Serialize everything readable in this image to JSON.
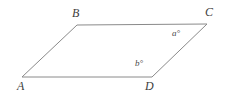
{
  "figure": {
    "type": "parallelogram",
    "background_color": "#ffffff",
    "stroke_color": "#8a8a8a",
    "label_color": "#3d3d3d",
    "width": 228,
    "height": 98,
    "vertices": [
      {
        "name": "A",
        "label": "A",
        "x": 22,
        "y": 77
      },
      {
        "name": "B",
        "label": "B",
        "x": 77,
        "y": 25
      },
      {
        "name": "C",
        "label": "C",
        "x": 207,
        "y": 24
      },
      {
        "name": "D",
        "label": "D",
        "x": 152,
        "y": 77
      }
    ],
    "edges": [
      {
        "name": "edge-AB",
        "from": "A",
        "to": "B"
      },
      {
        "name": "edge-BC",
        "from": "B",
        "to": "C"
      },
      {
        "name": "edge-CD",
        "from": "C",
        "to": "D"
      },
      {
        "name": "edge-DA",
        "from": "D",
        "to": "A"
      }
    ],
    "angle_labels": [
      {
        "name": "angle-a",
        "label": "a°",
        "at_vertex": "C",
        "x": 177,
        "y": 34
      },
      {
        "name": "angle-b",
        "label": "b°",
        "at_vertex": "D",
        "x": 141,
        "y": 64
      }
    ],
    "path": "M 22 77 L 77 25 L 207 24 L 152 77 Z"
  }
}
